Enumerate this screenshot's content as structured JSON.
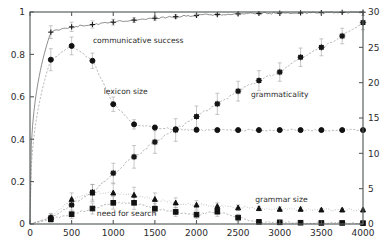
{
  "figure": {
    "background": "#ffffff",
    "plot_area": {
      "left": 30,
      "top": 12,
      "right": 363,
      "bottom": 224
    }
  },
  "chart_data": {
    "type": "line",
    "title": "",
    "xlabel": "",
    "ylabel": "",
    "y2label": "",
    "xlim": [
      0,
      4000
    ],
    "ylim": [
      0,
      1
    ],
    "y2lim": [
      0,
      30
    ],
    "grid": false,
    "legend_position": "inline-annotations",
    "xticks": [
      0,
      500,
      1000,
      1500,
      2000,
      2500,
      3000,
      3500,
      4000
    ],
    "xtick_labels": [
      "0",
      "500",
      "1000",
      "1500",
      "2000",
      "2500",
      "3000",
      "3500",
      "4000"
    ],
    "yticks": [
      0,
      0.2,
      0.4,
      0.6,
      0.8,
      1
    ],
    "ytick_labels": [
      "0",
      "0.2",
      "0.4",
      "0.6",
      "0.8",
      "1"
    ],
    "y2ticks": [
      0,
      5,
      10,
      15,
      20,
      25,
      30
    ],
    "y2tick_labels": [
      "0",
      "5",
      "10",
      "15",
      "20",
      "25",
      "30"
    ],
    "annotations": [
      {
        "text": "communicative success",
        "x": 1300,
        "y": 0.855,
        "axis": "left"
      },
      {
        "text": "lexicon size",
        "x": 1150,
        "y": 0.615,
        "axis": "left"
      },
      {
        "text": "grammaticality",
        "x": 3000,
        "y": 0.6,
        "axis": "left"
      },
      {
        "text": "grammar size",
        "x": 3020,
        "y": 0.105,
        "axis": "left"
      },
      {
        "text": "need for search",
        "x": 1160,
        "y": 0.04,
        "axis": "left"
      }
    ],
    "series": [
      {
        "name": "communicative success",
        "axis": "left",
        "marker": "plus",
        "linestyle": "solid",
        "color": "#6f6f6f",
        "x": [
          250,
          500,
          750,
          1000,
          1250,
          1500,
          1750,
          2000,
          2250,
          2500,
          2750,
          3000,
          3250,
          3500,
          3750,
          4000
        ],
        "values": [
          0.905,
          0.93,
          0.941,
          0.952,
          0.962,
          0.971,
          0.978,
          0.984,
          0.988,
          0.991,
          0.993,
          0.995,
          0.996,
          0.997,
          0.998,
          0.999
        ],
        "errors": [
          0.03,
          0.022,
          0.017,
          0.014,
          0.011,
          0.009,
          0.008,
          0.006,
          0.005,
          0.004,
          0.004,
          0.003,
          0.003,
          0.002,
          0.002,
          0.002
        ]
      },
      {
        "name": "lexicon size",
        "axis": "left",
        "marker": "circle",
        "linestyle": "dashed",
        "color": "#8d8d8d",
        "x": [
          250,
          500,
          750,
          1000,
          1250,
          1500,
          1750,
          2000,
          2250,
          2500,
          2750,
          3000,
          3250,
          3500,
          3750,
          4000
        ],
        "values": [
          0.775,
          0.84,
          0.77,
          0.565,
          0.47,
          0.455,
          0.447,
          0.444,
          0.443,
          0.443,
          0.443,
          0.443,
          0.443,
          0.443,
          0.443,
          0.443
        ],
        "errors": [
          0.052,
          0.042,
          0.036,
          0.034,
          0.022,
          0.012,
          0.009,
          0.008,
          0.007,
          0.006,
          0.006,
          0.006,
          0.005,
          0.005,
          0.005,
          0.005
        ]
      },
      {
        "name": "grammaticality",
        "axis": "right",
        "marker": "star",
        "linestyle": "dashed",
        "color": "#8d8d8d",
        "x": [
          250,
          500,
          750,
          1000,
          1250,
          1500,
          1750,
          2000,
          2250,
          2500,
          2750,
          3000,
          3250,
          3500,
          3750,
          4000
        ],
        "values": [
          0.9,
          2.7,
          4.5,
          7.2,
          9.5,
          11.6,
          13.3,
          15.2,
          17.0,
          18.8,
          20.3,
          21.5,
          23.6,
          25.0,
          26.6,
          28.5
        ],
        "errors": [
          0.6,
          0.9,
          1.1,
          1.4,
          1.6,
          1.6,
          1.6,
          1.5,
          1.5,
          1.4,
          1.4,
          1.3,
          1.3,
          1.2,
          1.1,
          1.0
        ]
      },
      {
        "name": "grammar size",
        "axis": "right",
        "marker": "triangle",
        "linestyle": "dotted",
        "color": "#8d8d8d",
        "x": [
          250,
          500,
          750,
          1000,
          1250,
          1500,
          1750,
          2000,
          2250,
          2500,
          2750,
          3000,
          3250,
          3500,
          3750,
          4000
        ],
        "values": [
          0.9,
          3.5,
          4.4,
          4.4,
          4.1,
          3.5,
          3.0,
          2.7,
          2.5,
          2.3,
          2.2,
          2.1,
          2.1,
          2.0,
          2.0,
          2.0
        ],
        "errors": [
          0.5,
          0.9,
          1.2,
          1.3,
          1.1,
          0.9,
          0.7,
          0.6,
          0.5,
          0.4,
          0.3,
          0.3,
          0.3,
          0.2,
          0.2,
          0.2
        ]
      },
      {
        "name": "need for search",
        "axis": "left",
        "marker": "square",
        "linestyle": "dashed",
        "color": "#8d8d8d",
        "x": [
          250,
          500,
          750,
          1000,
          1250,
          1500,
          1750,
          2000,
          2250,
          2500,
          2750,
          3000,
          3250,
          3500,
          3750,
          4000
        ],
        "values": [
          0.022,
          0.046,
          0.073,
          0.1,
          0.1,
          0.072,
          0.057,
          0.044,
          0.058,
          0.03,
          0.01,
          0.008,
          0.006,
          0.005,
          0.005,
          0.004
        ],
        "errors": [
          0.012,
          0.02,
          0.026,
          0.03,
          0.031,
          0.025,
          0.021,
          0.018,
          0.022,
          0.016,
          0.007,
          0.005,
          0.004,
          0.004,
          0.003,
          0.003
        ]
      }
    ]
  }
}
